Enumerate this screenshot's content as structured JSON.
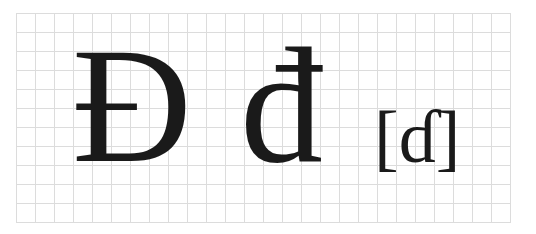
{
  "glyphs": {
    "uppercase": "Đ",
    "lowercase": "đ",
    "ipa": "[ɗ]"
  },
  "colors": {
    "glyph": "#1a1a1a",
    "grid_line": "#dcdcdc",
    "background": "#ffffff"
  }
}
